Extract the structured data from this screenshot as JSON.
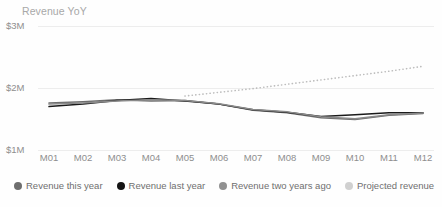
{
  "chart_data": {
    "type": "line",
    "title": "Revenue YoY",
    "xlabel": "",
    "ylabel": "",
    "ylim": [
      1000000,
      3000000
    ],
    "ytick_labels": [
      "$1M",
      "$2M",
      "$3M"
    ],
    "ytick_values": [
      1000000,
      2000000,
      3000000
    ],
    "grid": true,
    "legend_position": "bottom",
    "categories": [
      "M01",
      "M02",
      "M03",
      "M04",
      "M05",
      "M06",
      "M07",
      "M08",
      "M09",
      "M10",
      "M11",
      "M12"
    ],
    "series": [
      {
        "name": "Revenue this year",
        "color": "#6e6e6e",
        "style": "solid",
        "values": [
          1760000,
          1780000,
          1810000,
          1790000,
          1800000,
          1740000,
          1640000,
          1600000,
          1520000,
          1490000,
          1560000,
          1590000
        ]
      },
      {
        "name": "Revenue last year",
        "color": "#1a1a1a",
        "style": "solid",
        "values": [
          1700000,
          1740000,
          1800000,
          1830000,
          1790000,
          1740000,
          1650000,
          1610000,
          1540000,
          1570000,
          1600000,
          1600000
        ]
      },
      {
        "name": "Revenue two years ago",
        "color": "#8a8a8a",
        "style": "solid",
        "values": [
          1740000,
          1760000,
          1790000,
          1810000,
          1800000,
          1745000,
          1655000,
          1615000,
          1535000,
          1505000,
          1570000,
          1595000
        ]
      },
      {
        "name": "Projected revenue",
        "color": "#bdbdbd",
        "style": "dotted",
        "start_category": "M05",
        "values": [
          null,
          null,
          null,
          null,
          1870000,
          1930000,
          1990000,
          2060000,
          2130000,
          2200000,
          2270000,
          2350000
        ]
      }
    ]
  },
  "legend": {
    "items": [
      {
        "label": "Revenue this year",
        "color": "#6e6e6e"
      },
      {
        "label": "Revenue last year",
        "color": "#141414"
      },
      {
        "label": "Revenue two years ago",
        "color": "#919191"
      },
      {
        "label": "Projected revenue",
        "color": "#d0d0d0"
      }
    ]
  }
}
